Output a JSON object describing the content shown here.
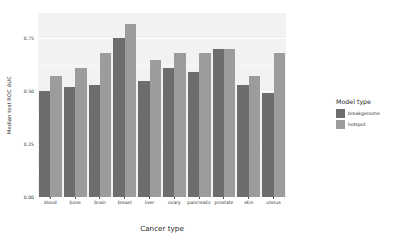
{
  "chart_data": {
    "type": "bar",
    "title": "",
    "xlabel": "Cancer type",
    "ylabel": "Median test ROC AUC",
    "categories": [
      "blood",
      "bone",
      "brain",
      "breast",
      "liver",
      "ovary",
      "pancreatic",
      "prostate",
      "skin",
      "uterus"
    ],
    "series": [
      {
        "name": "breakgenome",
        "color": "#6d6d6d",
        "values": [
          0.5,
          0.52,
          0.53,
          0.75,
          0.55,
          0.61,
          0.59,
          0.7,
          0.53,
          0.49
        ]
      },
      {
        "name": "hotspot",
        "color": "#9c9c9c",
        "values": [
          0.57,
          0.61,
          0.68,
          0.82,
          0.65,
          0.68,
          0.68,
          0.7,
          0.57,
          0.68
        ]
      }
    ],
    "ylim": [
      0.0,
      0.87
    ],
    "ytick_labels": [
      "0.00",
      "0.25",
      "0.50",
      "0.75"
    ],
    "ytick_values": [
      0.0,
      0.25,
      0.5,
      0.75
    ],
    "grid": true,
    "legend_position": "right",
    "legend_title": "Model type",
    "panel_background": "#f2f2f2",
    "grid_color": "#ffffff"
  },
  "legend": {
    "title": "Model type",
    "items": [
      {
        "label": "breakgenome",
        "color": "#6d6d6d"
      },
      {
        "label": "hotspot",
        "color": "#9c9c9c"
      }
    ]
  },
  "axes": {
    "x_title": "Cancer type",
    "y_title": "Median test ROC AUC"
  }
}
